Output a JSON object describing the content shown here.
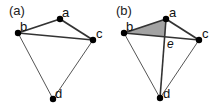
{
  "figure": {
    "panels": [
      {
        "label": "(a)",
        "nodes": [
          {
            "id": "a",
            "label": "a",
            "x": 60,
            "y": 19
          },
          {
            "id": "b",
            "label": "b",
            "x": 18,
            "y": 33
          },
          {
            "id": "c",
            "label": "c",
            "x": 93,
            "y": 40
          },
          {
            "id": "d",
            "label": "d",
            "x": 53,
            "y": 99
          }
        ],
        "edges": [
          [
            "a",
            "b"
          ],
          [
            "a",
            "c"
          ],
          [
            "b",
            "c"
          ],
          [
            "b",
            "d"
          ],
          [
            "c",
            "d"
          ]
        ]
      },
      {
        "label": "(b)",
        "nodes": [
          {
            "id": "a",
            "label": "a",
            "x": 166,
            "y": 19
          },
          {
            "id": "b",
            "label": "b",
            "x": 124,
            "y": 33
          },
          {
            "id": "c",
            "label": "c",
            "x": 199,
            "y": 40
          },
          {
            "id": "d",
            "label": "d",
            "x": 160,
            "y": 98
          }
        ],
        "edges": [
          [
            "a",
            "b"
          ],
          [
            "a",
            "c"
          ],
          [
            "b",
            "c"
          ],
          [
            "b",
            "d"
          ],
          [
            "c",
            "d"
          ],
          [
            "a",
            "d"
          ]
        ],
        "intersection_label": "e",
        "shaded_region": "triangle a-b-e",
        "shade_color": "#a0a0a0"
      }
    ]
  }
}
